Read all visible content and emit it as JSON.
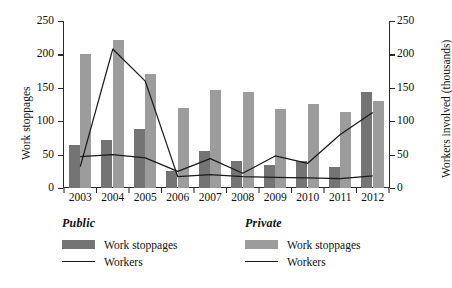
{
  "chart_data": {
    "type": "bar",
    "title": "",
    "xlabel": "",
    "ylabel": "Work stoppages",
    "y2label": "Workers involved (thousands)",
    "categories": [
      "2003",
      "2004",
      "2005",
      "2006",
      "2007",
      "2008",
      "2009",
      "2010",
      "2011",
      "2012"
    ],
    "ylim": [
      0,
      250
    ],
    "y2lim": [
      0,
      250
    ],
    "yticks": [
      "0",
      "50",
      "100",
      "150",
      "200",
      "250"
    ],
    "y2ticks": [
      "0",
      "50",
      "100",
      "150",
      "200",
      "250"
    ],
    "grid": false,
    "legend_position": "below",
    "series": [
      {
        "name": "Public Work stoppages",
        "group": "Public",
        "kind": "bar",
        "axis": "left",
        "color": "#747474",
        "values": [
          65,
          72,
          89,
          25,
          55,
          40,
          35,
          40,
          31,
          143
        ]
      },
      {
        "name": "Private Work stoppages",
        "group": "Private",
        "kind": "bar",
        "axis": "left",
        "color": "#9c9c9c",
        "values": [
          200,
          222,
          171,
          120,
          146,
          144,
          118,
          126,
          114,
          131
        ]
      },
      {
        "name": "Public Workers",
        "group": "Public",
        "kind": "line",
        "axis": "right",
        "color": "#1a1a1a",
        "values": [
          47,
          50,
          45,
          25,
          44,
          22,
          48,
          37,
          80,
          113
        ]
      },
      {
        "name": "Private Workers",
        "group": "Private",
        "kind": "line",
        "axis": "right",
        "color": "#1a1a1a",
        "values": [
          32,
          208,
          160,
          17,
          20,
          17,
          16,
          15,
          14,
          18
        ]
      }
    ]
  },
  "axes": {
    "left_title": "Work stoppages",
    "right_title": "Workers involved (thousands)"
  },
  "legend": {
    "public": {
      "title": "Public",
      "bar_label": "Work stoppages",
      "line_label": "Workers",
      "bar_color": "#747474",
      "line_color": "#1a1a1a"
    },
    "private": {
      "title": "Private",
      "bar_label": "Work stoppages",
      "line_label": "Workers",
      "bar_color": "#9c9c9c",
      "line_color": "#1a1a1a"
    }
  }
}
